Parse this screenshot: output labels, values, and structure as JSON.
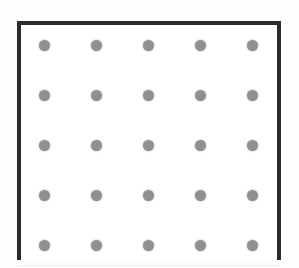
{
  "figure": {
    "kind": "dot-grid-diagram",
    "canvas": {
      "width": 299,
      "height": 268
    },
    "background_color": "#ffffff",
    "scan_background_color": "#fdfdfd"
  },
  "frame": {
    "label": "panel-border",
    "color": "#2b2b2b",
    "thickness": 4,
    "left": 17,
    "top": 21,
    "width": 264,
    "height": 239,
    "bottom_edge_visible": false,
    "note": "Frame is cut off by the bottom edge of the image",
    "interior_color": "#ffffff"
  },
  "baseline": {
    "label": "scan-baseline",
    "color": "#ededed",
    "top": 265
  },
  "grid": {
    "rows": 5,
    "columns": 5,
    "dot_count": 25,
    "dot_color": "#909090",
    "dot_diameter": 11,
    "column_spacing": 52,
    "row_spacing": 50,
    "column_centers": [
      44,
      96,
      148,
      200,
      252
    ],
    "row_centers": [
      45,
      95,
      145,
      195,
      245
    ],
    "dots": [
      {
        "row": 1,
        "col": 1,
        "x": 44,
        "y": 45
      },
      {
        "row": 1,
        "col": 2,
        "x": 96,
        "y": 45
      },
      {
        "row": 1,
        "col": 3,
        "x": 148,
        "y": 45
      },
      {
        "row": 1,
        "col": 4,
        "x": 200,
        "y": 45
      },
      {
        "row": 1,
        "col": 5,
        "x": 252,
        "y": 45
      },
      {
        "row": 2,
        "col": 1,
        "x": 44,
        "y": 95
      },
      {
        "row": 2,
        "col": 2,
        "x": 96,
        "y": 95
      },
      {
        "row": 2,
        "col": 3,
        "x": 148,
        "y": 95
      },
      {
        "row": 2,
        "col": 4,
        "x": 200,
        "y": 95
      },
      {
        "row": 2,
        "col": 5,
        "x": 252,
        "y": 95
      },
      {
        "row": 3,
        "col": 1,
        "x": 44,
        "y": 145
      },
      {
        "row": 3,
        "col": 2,
        "x": 96,
        "y": 145
      },
      {
        "row": 3,
        "col": 3,
        "x": 148,
        "y": 145
      },
      {
        "row": 3,
        "col": 4,
        "x": 200,
        "y": 145
      },
      {
        "row": 3,
        "col": 5,
        "x": 252,
        "y": 145
      },
      {
        "row": 4,
        "col": 1,
        "x": 44,
        "y": 195
      },
      {
        "row": 4,
        "col": 2,
        "x": 96,
        "y": 195
      },
      {
        "row": 4,
        "col": 3,
        "x": 148,
        "y": 195
      },
      {
        "row": 4,
        "col": 4,
        "x": 200,
        "y": 195
      },
      {
        "row": 4,
        "col": 5,
        "x": 252,
        "y": 195
      },
      {
        "row": 5,
        "col": 1,
        "x": 44,
        "y": 245
      },
      {
        "row": 5,
        "col": 2,
        "x": 96,
        "y": 245
      },
      {
        "row": 5,
        "col": 3,
        "x": 148,
        "y": 245
      },
      {
        "row": 5,
        "col": 4,
        "x": 200,
        "y": 245
      },
      {
        "row": 5,
        "col": 5,
        "x": 252,
        "y": 245
      }
    ]
  }
}
